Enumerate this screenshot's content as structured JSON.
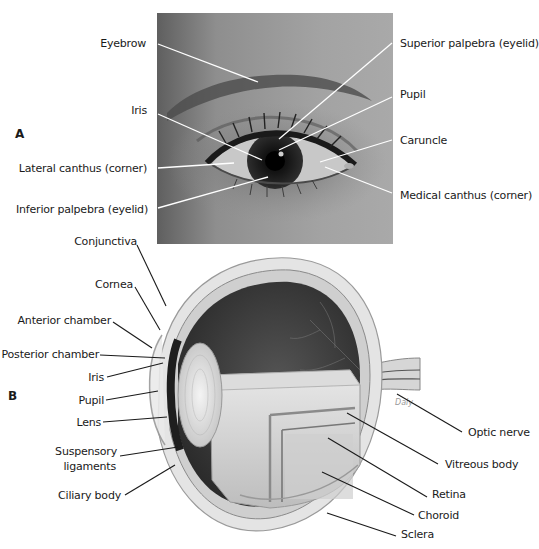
{
  "panel_a": {
    "letter": "A",
    "labels_left": [
      {
        "text": "Eyebrow"
      },
      {
        "text": "Iris"
      },
      {
        "text": "Lateral canthus (corner)"
      },
      {
        "text": "Inferior palpebra (eyelid)"
      }
    ],
    "labels_right": [
      {
        "text": "Superior palpebra (eyelid)"
      },
      {
        "text": "Pupil"
      },
      {
        "text": "Caruncle"
      },
      {
        "text": "Medical canthus (corner)"
      }
    ]
  },
  "panel_b": {
    "letter": "B",
    "labels_left": [
      {
        "text": "Conjunctiva"
      },
      {
        "text": "Cornea"
      },
      {
        "text": "Anterior chamber"
      },
      {
        "text": "Posterior chamber"
      },
      {
        "text": "Iris"
      },
      {
        "text": "Pupil"
      },
      {
        "text": "Lens"
      },
      {
        "text": "Suspensory"
      },
      {
        "text": "ligaments"
      },
      {
        "text": "Ciliary body"
      }
    ],
    "labels_right": [
      {
        "text": "Optic nerve"
      },
      {
        "text": "Vitreous body"
      },
      {
        "text": "Retina"
      },
      {
        "text": "Choroid"
      },
      {
        "text": "Sclera"
      }
    ],
    "signature": "Daly"
  },
  "colors": {
    "photo_bg": "#8c8c8c",
    "leader_on_photo": "#ffffff",
    "leader_on_white": "#1a1a1a",
    "vitreous_dark": "#3a3a3a",
    "sclera": "#e6e6e6"
  }
}
